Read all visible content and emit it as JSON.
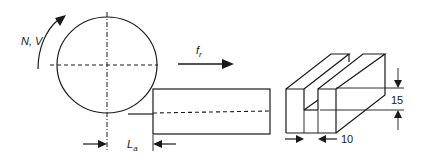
{
  "diagram": {
    "type": "grinding-setup-schematic",
    "wheel": {
      "rotation_label": "N, V"
    },
    "feed": {
      "label_main": "f",
      "label_sub": "r"
    },
    "workpiece": {
      "contact_length_label_main": "L",
      "contact_length_label_sub": "a"
    },
    "slot_block": {
      "depth_dimension": "15",
      "width_dimension": "10"
    },
    "colors": {
      "line": "#1a1a1a",
      "background": "#ffffff"
    }
  }
}
